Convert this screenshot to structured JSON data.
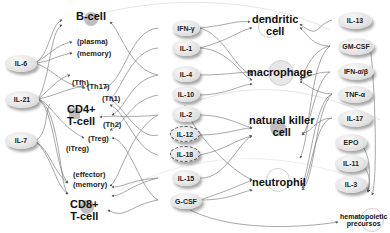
{
  "left_cytokines": [
    {
      "id": "il6",
      "label": "IL-6"
    },
    {
      "id": "il21",
      "label": "IL-21"
    },
    {
      "id": "il7",
      "label": "IL-7"
    }
  ],
  "lymphocytes": {
    "b_cell": {
      "label": "B-cell",
      "subtypes": [
        "(plasma)",
        "(memory)"
      ]
    },
    "cd4_t_cell": {
      "label_line1": "CD4+",
      "label_line2": "T-cell",
      "subtypes": [
        "(Tfh)",
        "(Th17)",
        "(Th1)",
        "(Th2)",
        "(Treg)",
        "(iTreg)"
      ]
    },
    "cd8_t_cell": {
      "label_line1": "CD8+",
      "label_line2": "T-cell",
      "subtypes": [
        "(effector)",
        "(memory)"
      ]
    }
  },
  "middle_cytokines": [
    {
      "id": "ifng",
      "label": "IFN-γ",
      "dashed": false
    },
    {
      "id": "il1",
      "label": "IL-1",
      "dashed": false
    },
    {
      "id": "il4",
      "label": "IL-4",
      "dashed": false
    },
    {
      "id": "il10",
      "label": "IL-10",
      "dashed": false
    },
    {
      "id": "il2",
      "label": "IL-2",
      "dashed": false
    },
    {
      "id": "il12",
      "label": "IL-12",
      "dashed": true
    },
    {
      "id": "il18",
      "label": "IL-18",
      "dashed": true
    },
    {
      "id": "il15",
      "label": "IL-15",
      "dashed": false
    },
    {
      "id": "gcsf",
      "label": "G-CSF",
      "dashed": false
    }
  ],
  "innate_cells": {
    "dendritic": {
      "line1": "dendritic",
      "line2": "cell"
    },
    "macrophage": {
      "line1": "macrophage"
    },
    "nk": {
      "line1": "natural killer",
      "line2": "cell"
    },
    "neutrophil": {
      "line1": "neutrophil"
    }
  },
  "right_cytokines": [
    {
      "id": "il13",
      "label": "IL-13"
    },
    {
      "id": "gmcsf",
      "label": "GM-CSF"
    },
    {
      "id": "ifnab",
      "label": "IFN-α/β"
    },
    {
      "id": "tnfa",
      "label": "TNF-α"
    },
    {
      "id": "il17",
      "label": "IL-17"
    },
    {
      "id": "epo",
      "label": "EPO"
    },
    {
      "id": "il11",
      "label": "IL-11"
    },
    {
      "id": "il3",
      "label": "IL-3"
    }
  ],
  "hematopoietic": {
    "line1": "hematopoietic",
    "line2": "precursos"
  }
}
